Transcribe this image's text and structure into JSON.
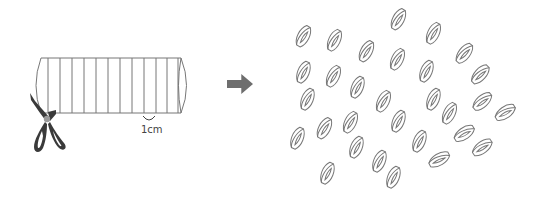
{
  "diagram": {
    "type": "instruction-illustration",
    "colors": {
      "line": "#777777",
      "scissors_blade": "#3a3a3a",
      "scissors_pivot": "#9a9a9a",
      "arrow": "#6e6e6e",
      "background": "#ffffff"
    },
    "tube": {
      "x": 36,
      "y": 58,
      "width": 150,
      "height": 55,
      "cut_lines_x": [
        48,
        60,
        72,
        84,
        96,
        108,
        120,
        132,
        144,
        156,
        167,
        178
      ]
    },
    "measurement": {
      "label": "1cm",
      "bracket_x1": 143,
      "bracket_x2": 155,
      "bracket_y": 116,
      "label_x": 141,
      "label_y": 134
    },
    "scissors": {
      "pivot_x": 47,
      "pivot_y": 119
    },
    "arrow": {
      "x": 227,
      "y": 74,
      "width": 26,
      "height": 20
    },
    "rings": [
      {
        "x": 303,
        "y": 36,
        "rot": 30
      },
      {
        "x": 334,
        "y": 40,
        "rot": 28
      },
      {
        "x": 366,
        "y": 51,
        "rot": 30
      },
      {
        "x": 398,
        "y": 19,
        "rot": 30
      },
      {
        "x": 433,
        "y": 33,
        "rot": 28
      },
      {
        "x": 464,
        "y": 53,
        "rot": 40
      },
      {
        "x": 480,
        "y": 74,
        "rot": 45
      },
      {
        "x": 303,
        "y": 72,
        "rot": 25
      },
      {
        "x": 333,
        "y": 76,
        "rot": 28
      },
      {
        "x": 397,
        "y": 59,
        "rot": 28
      },
      {
        "x": 426,
        "y": 71,
        "rot": 25
      },
      {
        "x": 357,
        "y": 87,
        "rot": 25
      },
      {
        "x": 307,
        "y": 99,
        "rot": 25
      },
      {
        "x": 383,
        "y": 101,
        "rot": 28
      },
      {
        "x": 433,
        "y": 99,
        "rot": 25
      },
      {
        "x": 449,
        "y": 113,
        "rot": 28
      },
      {
        "x": 482,
        "y": 101,
        "rot": 50
      },
      {
        "x": 505,
        "y": 112,
        "rot": 58
      },
      {
        "x": 398,
        "y": 121,
        "rot": 25
      },
      {
        "x": 350,
        "y": 122,
        "rot": 28
      },
      {
        "x": 324,
        "y": 128,
        "rot": 30
      },
      {
        "x": 297,
        "y": 138,
        "rot": 25
      },
      {
        "x": 356,
        "y": 147,
        "rot": 25
      },
      {
        "x": 419,
        "y": 141,
        "rot": 25
      },
      {
        "x": 464,
        "y": 133,
        "rot": 58
      },
      {
        "x": 482,
        "y": 147,
        "rot": 55
      },
      {
        "x": 439,
        "y": 159,
        "rot": 62
      },
      {
        "x": 379,
        "y": 161,
        "rot": 25
      },
      {
        "x": 393,
        "y": 177,
        "rot": 25
      },
      {
        "x": 327,
        "y": 173,
        "rot": 25
      }
    ]
  }
}
